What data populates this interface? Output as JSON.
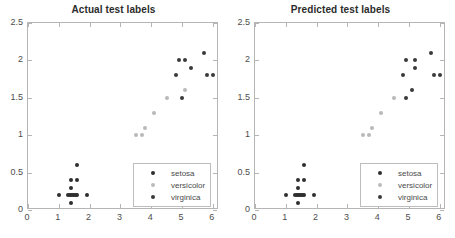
{
  "chart_data": [
    {
      "type": "scatter",
      "title": "Actual test labels",
      "xlabel": "",
      "ylabel": "",
      "xlim": [
        0,
        6.2
      ],
      "ylim": [
        0,
        2.5
      ],
      "xticks": [
        "0",
        "1",
        "2",
        "3",
        "4",
        "5",
        "6"
      ],
      "xtick_values": [
        0,
        1,
        2,
        3,
        4,
        5,
        6
      ],
      "yticks": [
        "0",
        "0.5",
        "1",
        "1.5",
        "2",
        "2.5"
      ],
      "ytick_values": [
        0,
        0.5,
        1,
        1.5,
        2,
        2.5
      ],
      "grid": false,
      "legend_position": "lower right",
      "series": [
        {
          "name": "setosa",
          "color": "#2f2f2f",
          "points": [
            [
              1.0,
              0.2
            ],
            [
              1.3,
              0.2
            ],
            [
              1.35,
              0.2
            ],
            [
              1.4,
              0.2
            ],
            [
              1.45,
              0.2
            ],
            [
              1.5,
              0.2
            ],
            [
              1.55,
              0.2
            ],
            [
              1.6,
              0.2
            ],
            [
              1.9,
              0.2
            ],
            [
              1.4,
              0.1
            ],
            [
              1.4,
              0.3
            ],
            [
              1.4,
              0.4
            ],
            [
              1.6,
              0.4
            ],
            [
              1.6,
              0.6
            ]
          ]
        },
        {
          "name": "versicolor",
          "color": "#b9b9b9",
          "points": [
            [
              3.5,
              1.0
            ],
            [
              3.7,
              1.0
            ],
            [
              3.8,
              1.1
            ],
            [
              4.1,
              1.3
            ],
            [
              4.5,
              1.5
            ],
            [
              5.1,
              1.6
            ]
          ]
        },
        {
          "name": "virginica",
          "color": "#3a3a3a",
          "points": [
            [
              4.8,
              1.8
            ],
            [
              4.9,
              2.0
            ],
            [
              5.1,
              2.0
            ],
            [
              5.0,
              1.5
            ],
            [
              5.3,
              1.9
            ],
            [
              5.7,
              2.1
            ],
            [
              5.8,
              1.8
            ],
            [
              6.0,
              1.8
            ]
          ]
        }
      ]
    },
    {
      "type": "scatter",
      "title": "Predicted test labels",
      "xlabel": "",
      "ylabel": "",
      "xlim": [
        0,
        6.2
      ],
      "ylim": [
        0,
        2.5
      ],
      "xticks": [
        "0",
        "1",
        "2",
        "3",
        "4",
        "5",
        "6"
      ],
      "xtick_values": [
        0,
        1,
        2,
        3,
        4,
        5,
        6
      ],
      "yticks": [
        "0",
        "0.5",
        "1",
        "1.5",
        "2",
        "2.5"
      ],
      "ytick_values": [
        0,
        0.5,
        1,
        1.5,
        2,
        2.5
      ],
      "grid": false,
      "legend_position": "lower right",
      "series": [
        {
          "name": "setosa",
          "color": "#2f2f2f",
          "points": [
            [
              1.0,
              0.2
            ],
            [
              1.3,
              0.2
            ],
            [
              1.35,
              0.2
            ],
            [
              1.4,
              0.2
            ],
            [
              1.45,
              0.2
            ],
            [
              1.5,
              0.2
            ],
            [
              1.55,
              0.2
            ],
            [
              1.6,
              0.2
            ],
            [
              1.9,
              0.2
            ],
            [
              1.4,
              0.1
            ],
            [
              1.4,
              0.3
            ],
            [
              1.4,
              0.4
            ],
            [
              1.6,
              0.4
            ],
            [
              1.6,
              0.6
            ]
          ]
        },
        {
          "name": "versicolor",
          "color": "#b9b9b9",
          "points": [
            [
              3.5,
              1.0
            ],
            [
              3.7,
              1.0
            ],
            [
              3.8,
              1.1
            ],
            [
              4.1,
              1.3
            ],
            [
              4.5,
              1.5
            ]
          ]
        },
        {
          "name": "virginica",
          "color": "#3a3a3a",
          "points": [
            [
              4.8,
              1.8
            ],
            [
              4.9,
              2.0
            ],
            [
              5.2,
              2.0
            ],
            [
              4.9,
              1.5
            ],
            [
              5.1,
              1.6
            ],
            [
              5.2,
              1.9
            ],
            [
              5.7,
              2.1
            ],
            [
              5.8,
              1.8
            ],
            [
              6.0,
              1.8
            ]
          ]
        }
      ]
    }
  ],
  "legend": {
    "entries": [
      {
        "label": "setosa",
        "key": "setosa"
      },
      {
        "label": "versicolor",
        "key": "versicolor"
      },
      {
        "label": "virginica",
        "key": "virginica"
      }
    ]
  },
  "colors": {
    "setosa": "#2f2f2f",
    "versicolor": "#b9b9b9",
    "virginica": "#3a3a3a",
    "axis": "#b5b5b5",
    "text": "#4d4d4d",
    "title": "#2b2b2b",
    "background": "#ffffff"
  }
}
